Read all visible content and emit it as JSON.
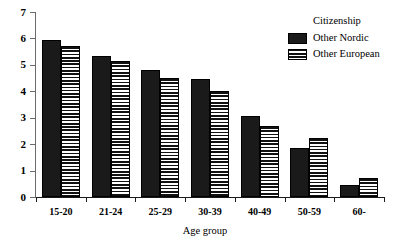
{
  "chart_data": {
    "type": "bar",
    "title": "",
    "xlabel": "Age group",
    "ylabel": "",
    "categories": [
      "15-20",
      "21-24",
      "25-29",
      "30-39",
      "40-49",
      "50-59",
      "60-"
    ],
    "series": [
      {
        "name": "Other Nordic",
        "pattern": "solid",
        "color": "#1a1a1a",
        "values": [
          5.95,
          5.35,
          4.8,
          4.45,
          3.05,
          1.85,
          0.45
        ]
      },
      {
        "name": "Other European",
        "pattern": "horizontal-stripes",
        "color": "#ffffff",
        "values": [
          5.7,
          5.15,
          4.5,
          4.0,
          2.7,
          2.25,
          0.72
        ]
      }
    ],
    "ylim": [
      0,
      7
    ],
    "yticks": [
      0,
      1,
      2,
      3,
      4,
      5,
      6,
      7
    ],
    "ytick_labels": [
      "0",
      "1",
      "2",
      "3",
      "4",
      "5",
      "6",
      "7"
    ],
    "grid": false,
    "legend_position": "top-right"
  },
  "legend": {
    "title": "Citizenship",
    "entries": [
      {
        "label": "Other Nordic",
        "swatch": "solid-black-swatch"
      },
      {
        "label": "Other European",
        "swatch": "horizontal-stripe-swatch"
      }
    ]
  }
}
